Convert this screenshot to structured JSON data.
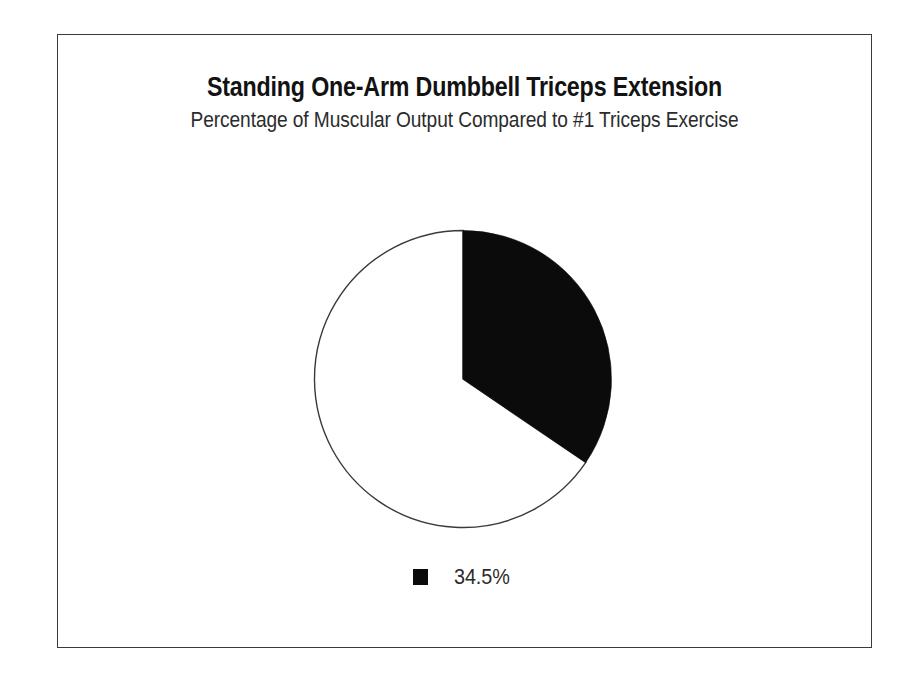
{
  "figure": {
    "title": "Standing One-Arm Dumbbell Triceps Extension",
    "subtitle": "Percentage of Muscular Output Compared to #1 Triceps Exercise",
    "border_color": "#3a3a3a",
    "background_color": "#ffffff"
  },
  "legend": {
    "position": "bottom-center",
    "entries": [
      {
        "label": "34.5%",
        "color": "#0b0b0b",
        "swatch": "filled-square"
      }
    ]
  },
  "chart_data": {
    "type": "pie",
    "title": "Standing One-Arm Dumbbell Triceps Extension",
    "subtitle": "Percentage of Muscular Output Compared to #1 Triceps Exercise",
    "xlabel": "",
    "ylabel": "",
    "categories": [
      "34.5%",
      "Remainder"
    ],
    "values": [
      34.5,
      65.5
    ],
    "labels": [
      "34.5%",
      ""
    ],
    "colors": [
      "#0b0b0b",
      "#ffffff"
    ],
    "start_angle_deg": 0,
    "direction": "clockwise",
    "outline_color": "#3a3a3a",
    "grid": false,
    "legend_entries": [
      "34.5%"
    ],
    "annotations": []
  }
}
